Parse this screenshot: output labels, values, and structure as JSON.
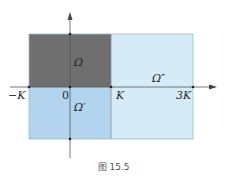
{
  "figure": {
    "caption": "图 15.5",
    "colors": {
      "omega": "#6f6f6f",
      "omega_prime": "#b3d4ef",
      "omega_double_prime": "#d6ebf8",
      "border": "#8aa9c0",
      "axis": "#555555"
    },
    "regions": [
      {
        "id": "omega",
        "label": "Ω",
        "x_range": [
          "0-left",
          "K"
        ],
        "y_range": [
          "0",
          "top"
        ]
      },
      {
        "id": "omega_prime",
        "label": "Ω′",
        "x_range": [
          "-K",
          "K"
        ],
        "y_range": [
          "bottom",
          "0"
        ]
      },
      {
        "id": "omega_double_prime",
        "label": "Ω″",
        "x_range": [
          "K",
          "3K"
        ],
        "y_range": [
          "bottom",
          "top"
        ]
      }
    ],
    "axis_labels": {
      "neg_k": "−K",
      "zero": "0",
      "k": "K",
      "three_k": "3K"
    },
    "region_labels": {
      "omega": "Ω",
      "omega_prime": "Ω′",
      "omega_double_prime": "Ω″"
    }
  }
}
